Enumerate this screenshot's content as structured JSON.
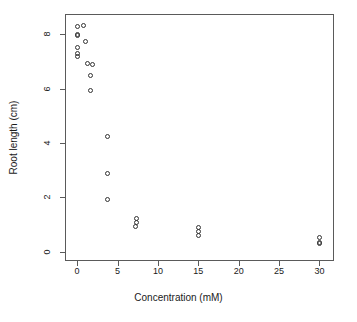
{
  "chart_data": {
    "type": "scatter",
    "title": "",
    "xlabel": "Concentration (mM)",
    "ylabel": "Root length (cm)",
    "xlim": [
      -1.5,
      31.8
    ],
    "ylim": [
      -0.35,
      8.75
    ],
    "xticks": [
      0,
      5,
      10,
      15,
      20,
      25,
      30
    ],
    "xtick_labels": [
      "0",
      "5",
      "10",
      "15",
      "20",
      "25",
      "30"
    ],
    "yticks": [
      0,
      2,
      4,
      6,
      8
    ],
    "ytick_labels": [
      "0",
      "2",
      "4",
      "6",
      "8"
    ],
    "grid": false,
    "legend": null,
    "marker": "open-circle",
    "marker_color": "#333333",
    "points": [
      {
        "x": 0.0,
        "y": 8.3
      },
      {
        "x": 0.75,
        "y": 8.32
      },
      {
        "x": 0.0,
        "y": 7.98
      },
      {
        "x": 0.0,
        "y": 7.96
      },
      {
        "x": 1.0,
        "y": 7.75
      },
      {
        "x": 0.0,
        "y": 7.52
      },
      {
        "x": 0.0,
        "y": 7.3
      },
      {
        "x": 0.0,
        "y": 7.2
      },
      {
        "x": 1.3,
        "y": 6.92
      },
      {
        "x": 1.85,
        "y": 6.88
      },
      {
        "x": 1.6,
        "y": 6.48
      },
      {
        "x": 1.6,
        "y": 5.95
      },
      {
        "x": 3.7,
        "y": 4.22
      },
      {
        "x": 3.7,
        "y": 2.88
      },
      {
        "x": 3.7,
        "y": 1.93
      },
      {
        "x": 7.35,
        "y": 1.22
      },
      {
        "x": 7.35,
        "y": 1.08
      },
      {
        "x": 7.25,
        "y": 0.92
      },
      {
        "x": 15.0,
        "y": 0.88
      },
      {
        "x": 15.0,
        "y": 0.72
      },
      {
        "x": 15.0,
        "y": 0.58
      },
      {
        "x": 30.0,
        "y": 0.52
      },
      {
        "x": 30.0,
        "y": 0.33
      },
      {
        "x": 30.0,
        "y": 0.29
      }
    ]
  }
}
